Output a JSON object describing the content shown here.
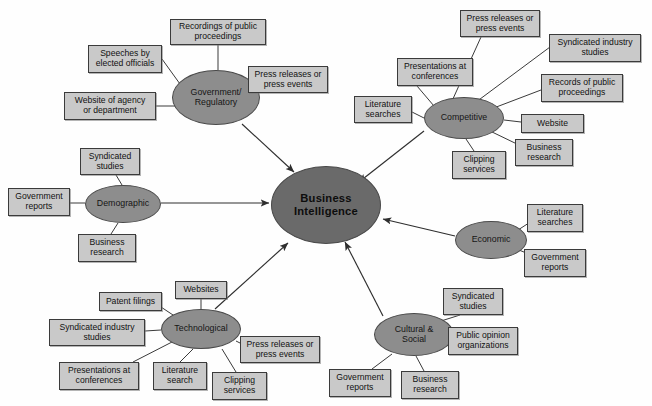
{
  "diagram": {
    "type": "mind-map",
    "colors": {
      "background": "#fefefe",
      "box_fill": "#c9c9c9",
      "category_fill": "#8d8d8d",
      "center_fill": "#6a6a6a",
      "stroke": "#3b3b3b",
      "text": "#111111"
    },
    "center": {
      "id": "business-intelligence",
      "label": "Business\nIntelligence",
      "x": 271,
      "y": 166,
      "w": 110,
      "h": 78
    },
    "categories": [
      {
        "id": "government-regulatory",
        "label": "Government/\nRegulatory",
        "x": 172,
        "y": 70,
        "w": 88,
        "h": 55,
        "sources": [
          {
            "id": "recordings-of-public-proceedings",
            "label": "Recordings of public\nproceedings",
            "x": 170,
            "y": 19,
            "w": 96,
            "h": 26
          },
          {
            "id": "speeches-by-elected-officials",
            "label": "Speeches by\nelected officials",
            "x": 88,
            "y": 45,
            "w": 74,
            "h": 28
          },
          {
            "id": "press-releases-or-press-events-gov",
            "label": "Press releases or\npress events",
            "x": 248,
            "y": 66,
            "w": 80,
            "h": 27
          },
          {
            "id": "website-of-agency-or-department",
            "label": "Website of agency\nor department",
            "x": 64,
            "y": 92,
            "w": 92,
            "h": 28
          }
        ]
      },
      {
        "id": "competitive",
        "label": "Competitive",
        "x": 424,
        "y": 97,
        "w": 80,
        "h": 42,
        "sources": [
          {
            "id": "press-releases-or-press-events-comp",
            "label": "Press releases or\npress events",
            "x": 460,
            "y": 10,
            "w": 80,
            "h": 27
          },
          {
            "id": "syndicated-industry-studies-comp",
            "label": "Syndicated industry\nstudies",
            "x": 549,
            "y": 34,
            "w": 92,
            "h": 28
          },
          {
            "id": "presentations-at-conferences-comp",
            "label": "Presentations at\nconferences",
            "x": 397,
            "y": 58,
            "w": 76,
            "h": 28
          },
          {
            "id": "records-of-public-proceedings-comp",
            "label": "Records of public\nproceedings",
            "x": 541,
            "y": 74,
            "w": 82,
            "h": 28
          },
          {
            "id": "literature-searches-comp",
            "label": "Literature\nsearches",
            "x": 354,
            "y": 96,
            "w": 58,
            "h": 27
          },
          {
            "id": "website-comp",
            "label": "Website",
            "x": 521,
            "y": 114,
            "w": 63,
            "h": 19
          },
          {
            "id": "business-research-comp",
            "label": "Business\nresearch",
            "x": 515,
            "y": 139,
            "w": 58,
            "h": 27
          },
          {
            "id": "clipping-services-comp",
            "label": "Clipping\nservices",
            "x": 452,
            "y": 151,
            "w": 54,
            "h": 28
          }
        ]
      },
      {
        "id": "demographic",
        "label": "Demographic",
        "x": 85,
        "y": 185,
        "w": 76,
        "h": 38,
        "sources": [
          {
            "id": "syndicated-studies-demo",
            "label": "Syndicated\nstudies",
            "x": 80,
            "y": 148,
            "w": 60,
            "h": 27
          },
          {
            "id": "government-reports-demo",
            "label": "Government\nreports",
            "x": 8,
            "y": 188,
            "w": 62,
            "h": 28
          },
          {
            "id": "business-research-demo",
            "label": "Business\nresearch",
            "x": 78,
            "y": 234,
            "w": 58,
            "h": 28
          }
        ]
      },
      {
        "id": "economic",
        "label": "Economic",
        "x": 455,
        "y": 221,
        "w": 72,
        "h": 38,
        "sources": [
          {
            "id": "literature-searches-econ",
            "label": "Literature\nsearches",
            "x": 527,
            "y": 204,
            "w": 56,
            "h": 28
          },
          {
            "id": "government-reports-econ",
            "label": "Government\nreports",
            "x": 524,
            "y": 249,
            "w": 62,
            "h": 28
          }
        ]
      },
      {
        "id": "technological",
        "label": "Technological",
        "x": 161,
        "y": 309,
        "w": 80,
        "h": 40,
        "sources": [
          {
            "id": "websites-tech",
            "label": "Websites",
            "x": 175,
            "y": 281,
            "w": 52,
            "h": 18
          },
          {
            "id": "patent-filings-tech",
            "label": "Patent filings",
            "x": 99,
            "y": 292,
            "w": 63,
            "h": 19
          },
          {
            "id": "syndicated-industry-studies-tech",
            "label": "Syndicated industry\nstudies",
            "x": 49,
            "y": 319,
            "w": 96,
            "h": 27
          },
          {
            "id": "presentations-at-conferences-tech",
            "label": "Presentations at\nconferences",
            "x": 59,
            "y": 362,
            "w": 80,
            "h": 28
          },
          {
            "id": "literature-search-tech",
            "label": "Literature\nsearch",
            "x": 153,
            "y": 362,
            "w": 54,
            "h": 28
          },
          {
            "id": "clipping-services-tech",
            "label": "Clipping\nservices",
            "x": 212,
            "y": 372,
            "w": 55,
            "h": 28
          },
          {
            "id": "press-releases-or-press-events-tech",
            "label": "Press releases or\npress events",
            "x": 240,
            "y": 336,
            "w": 80,
            "h": 27
          }
        ]
      },
      {
        "id": "cultural-social",
        "label": "Cultural &\nSocial",
        "x": 374,
        "y": 313,
        "w": 80,
        "h": 43,
        "sources": [
          {
            "id": "syndicated-studies-cult",
            "label": "Syndicated\nstudies",
            "x": 443,
            "y": 288,
            "w": 60,
            "h": 27
          },
          {
            "id": "public-opinion-organizations",
            "label": "Public opinion\norganizations",
            "x": 448,
            "y": 327,
            "w": 70,
            "h": 28
          },
          {
            "id": "government-reports-cult",
            "label": "Government\nreports",
            "x": 329,
            "y": 369,
            "w": 62,
            "h": 28
          },
          {
            "id": "business-research-cult",
            "label": "Business\nresearch",
            "x": 401,
            "y": 371,
            "w": 58,
            "h": 28
          }
        ]
      }
    ],
    "arrows": [
      {
        "from": "government-regulatory",
        "to": "business-intelligence"
      },
      {
        "from": "competitive",
        "to": "business-intelligence"
      },
      {
        "from": "demographic",
        "to": "business-intelligence"
      },
      {
        "from": "economic",
        "to": "business-intelligence"
      },
      {
        "from": "technological",
        "to": "business-intelligence"
      },
      {
        "from": "cultural-social",
        "to": "business-intelligence"
      }
    ]
  }
}
